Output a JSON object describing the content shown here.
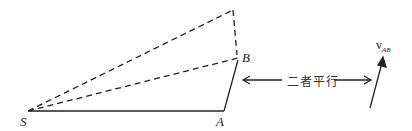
{
  "diagram": {
    "points": {
      "S": "S",
      "A": "A",
      "B": "B"
    },
    "parallel_text": "二者平行",
    "vector_label": {
      "main": "v",
      "sub": "AB"
    },
    "colors": {
      "line": "#222222"
    }
  }
}
